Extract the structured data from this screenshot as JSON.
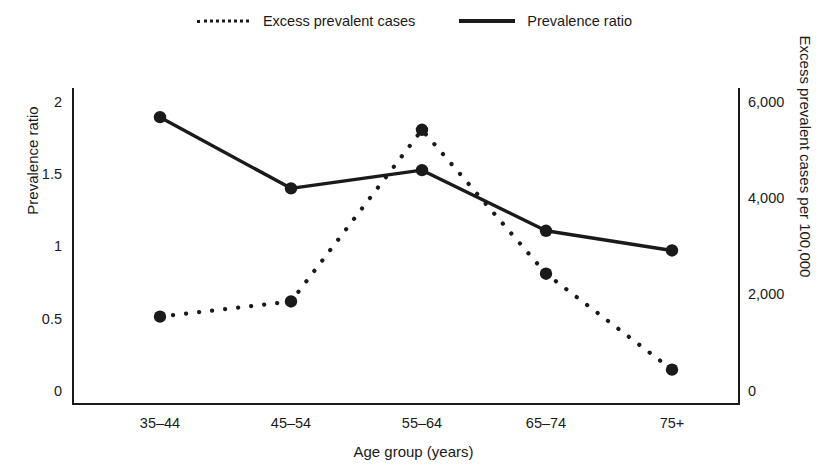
{
  "legend": {
    "entries": [
      {
        "label": "Excess prevalent cases",
        "style": "dotted",
        "icon": "dotted-line-icon"
      },
      {
        "label": "Prevalence ratio",
        "style": "solid",
        "icon": "solid-line-icon"
      }
    ]
  },
  "axes": {
    "x": {
      "title": "Age group (years)",
      "ticks": [
        "35–44",
        "45–54",
        "55–64",
        "65–74",
        "75+"
      ]
    },
    "y_left": {
      "title": "Prevalence ratio",
      "ticks": [
        "0",
        "0.5",
        "1",
        "1.5",
        "2"
      ],
      "values": [
        0,
        0.5,
        1,
        1.5,
        2
      ]
    },
    "y_right": {
      "title": "Excess prevalent cases per 100,000",
      "ticks": [
        "0",
        "2,000",
        "4,000",
        "6,000"
      ],
      "values": [
        0,
        2000,
        4000,
        6000
      ]
    }
  },
  "chart_data": {
    "type": "line",
    "title": "",
    "xlabel": "Age group (years)",
    "ylabel": "Prevalence ratio",
    "y2label": "Excess prevalent cases per 100,000",
    "categories": [
      "35–44",
      "45–54",
      "55–64",
      "65–74",
      "75+"
    ],
    "ylim": [
      0,
      2
    ],
    "y2lim": [
      0,
      6000
    ],
    "grid": false,
    "legend_position": "top-center",
    "series": [
      {
        "name": "Prevalence ratio",
        "axis": "left",
        "style": "solid",
        "marker": "circle",
        "color": "#1a1a1a",
        "values": [
          1.9,
          1.43,
          1.55,
          1.15,
          1.02
        ]
      },
      {
        "name": "Excess prevalent cases",
        "axis": "right",
        "style": "dotted",
        "marker": "circle",
        "color": "#1a1a1a",
        "values": [
          1750,
          2050,
          5450,
          2600,
          700
        ]
      }
    ]
  }
}
